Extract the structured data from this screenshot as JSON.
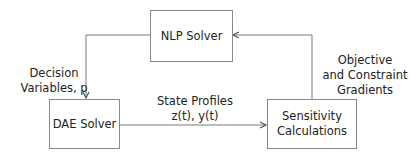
{
  "diagram": {
    "nodes": [
      {
        "id": "nlp",
        "label": "NLP Solver"
      },
      {
        "id": "dae",
        "label": "DAE Solver"
      },
      {
        "id": "sens",
        "label_line1": "Sensitivity",
        "label_line2": "Calculations"
      }
    ],
    "edges": [
      {
        "from": "nlp",
        "to": "dae",
        "label_line1": "Decision",
        "label_line2": "Variables, p"
      },
      {
        "from": "dae",
        "to": "sens",
        "label_line1": "State Profiles",
        "label_line2": "z(t), y(t)"
      },
      {
        "from": "sens",
        "to": "nlp",
        "label_line1": "Objective",
        "label_line2": "and Constraint",
        "label_line3": "Gradients"
      }
    ],
    "colors": {
      "line": "#7a7a7a",
      "box_border": "#8a8a8a",
      "text": "#222222"
    }
  }
}
